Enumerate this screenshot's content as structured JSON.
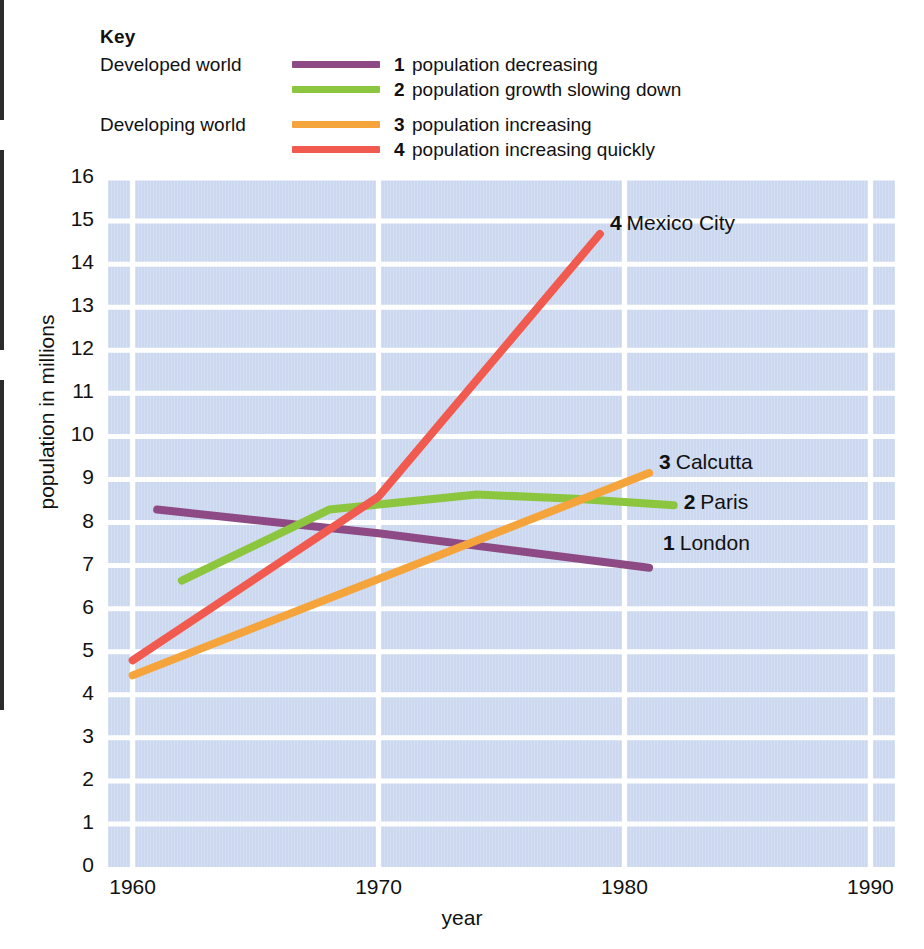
{
  "legend": {
    "title": "Key",
    "groups": [
      {
        "label": "Developed world"
      },
      {
        "label": "Developing world"
      }
    ],
    "entries": [
      {
        "number": "1",
        "description": "population decreasing",
        "color": "#8e4a84",
        "group": "Developed world"
      },
      {
        "number": "2",
        "description": "population growth slowing down",
        "color": "#8cc63f",
        "group": ""
      },
      {
        "number": "3",
        "description": "population increasing",
        "color": "#f5a43c",
        "group": "Developing world"
      },
      {
        "number": "4",
        "description": "population increasing quickly",
        "color": "#f05a4f",
        "group": ""
      }
    ]
  },
  "colors": {
    "plot_background": "#ccd8ef",
    "gridline": "#ffffff",
    "text": "#111111",
    "purple": "#8e4a84",
    "green": "#8cc63f",
    "orange": "#f5a43c",
    "red": "#f05a4f"
  },
  "chart_data": {
    "type": "line",
    "title": "",
    "xlabel": "year",
    "ylabel": "population in millions",
    "xlim": [
      1959,
      1991
    ],
    "ylim": [
      0,
      16
    ],
    "xticks": [
      "1960",
      "1970",
      "1980",
      "1990"
    ],
    "xtick_values": [
      1960,
      1970,
      1980,
      1990
    ],
    "yticks": [
      "0",
      "1",
      "2",
      "3",
      "4",
      "5",
      "6",
      "7",
      "8",
      "9",
      "10",
      "11",
      "12",
      "13",
      "14",
      "15",
      "16"
    ],
    "ytick_values": [
      0,
      1,
      2,
      3,
      4,
      5,
      6,
      7,
      8,
      9,
      10,
      11,
      12,
      13,
      14,
      15,
      16
    ],
    "grid": true,
    "legend_position": "top",
    "series": [
      {
        "name": "London",
        "number": "1",
        "label": "1 London",
        "color": "#8e4a84",
        "category": "population decreasing",
        "x": [
          1961,
          1970,
          1981
        ],
        "values": [
          8.3,
          7.75,
          6.95
        ]
      },
      {
        "name": "Paris",
        "number": "2",
        "label": "2 Paris",
        "color": "#8cc63f",
        "category": "population growth slowing down",
        "x": [
          1962,
          1968,
          1974,
          1978,
          1982
        ],
        "values": [
          6.65,
          8.3,
          8.65,
          8.55,
          8.4
        ]
      },
      {
        "name": "Calcutta",
        "number": "3",
        "label": "3 Calcutta",
        "color": "#f5a43c",
        "category": "population increasing",
        "x": [
          1960,
          1981
        ],
        "values": [
          4.45,
          9.15
        ]
      },
      {
        "name": "Mexico City",
        "number": "4",
        "label": "4 Mexico City",
        "color": "#f05a4f",
        "category": "population increasing quickly",
        "x": [
          1960,
          1970,
          1979
        ],
        "values": [
          4.8,
          8.6,
          14.7
        ]
      }
    ]
  }
}
